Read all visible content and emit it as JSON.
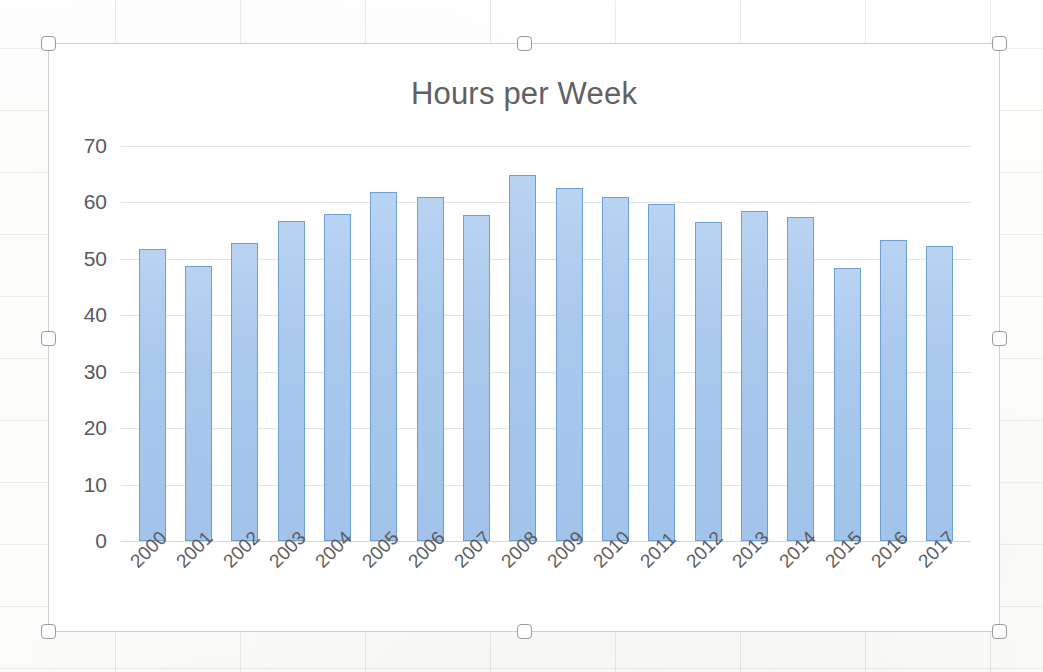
{
  "app": {
    "object_type": "chart-object",
    "selected": true
  },
  "selection": {
    "handles": [
      "top-left",
      "top-center",
      "top-right",
      "middle-left",
      "middle-right",
      "bottom-left",
      "bottom-center",
      "bottom-right"
    ]
  },
  "colors": {
    "bar_fill": "#a8c8ec",
    "bar_border": "#6d9ed6",
    "gridline": "#dfe4e8",
    "title_text": "#616161",
    "axis_text": "#5a5a5a",
    "chart_border": "#cfcfcf",
    "plot_background": "#ffffff"
  },
  "chart_data": {
    "type": "bar",
    "title": "Hours per Week",
    "xlabel": "",
    "ylabel": "",
    "ylim": [
      0,
      70
    ],
    "yticks": [
      0,
      10,
      20,
      30,
      40,
      50,
      60,
      70
    ],
    "ytick_labels": [
      "0",
      "10",
      "20",
      "30",
      "40",
      "50",
      "60",
      "70"
    ],
    "grid": true,
    "legend": false,
    "legend_position": "none",
    "categories": [
      "2000",
      "2001",
      "2002",
      "2003",
      "2004",
      "2005",
      "2006",
      "2007",
      "2008",
      "2009",
      "2010",
      "2011",
      "2012",
      "2013",
      "2014",
      "2015",
      "2016",
      "2017"
    ],
    "values": [
      51.7,
      48.7,
      52.8,
      56.8,
      57.9,
      61.8,
      61.0,
      57.8,
      64.9,
      62.6,
      61.0,
      59.7,
      56.6,
      58.5,
      57.5,
      48.4,
      53.4,
      52.3
    ],
    "series": [
      {
        "name": "Hours per Week",
        "values": [
          51.7,
          48.7,
          52.8,
          56.8,
          57.9,
          61.8,
          61.0,
          57.8,
          64.9,
          62.6,
          61.0,
          59.7,
          56.6,
          58.5,
          57.5,
          48.4,
          53.4,
          52.3
        ]
      }
    ]
  }
}
